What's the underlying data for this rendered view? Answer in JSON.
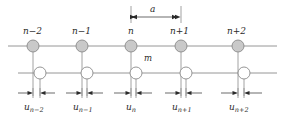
{
  "figure": {
    "type": "lattice-chain-diagram",
    "lattice_constant_label": "a",
    "mass_label": "m",
    "colors": {
      "shaded_atom_fill": "#c9c9c9",
      "shaded_atom_stroke": "#8a8a8a",
      "open_atom_fill": "#ffffff",
      "open_atom_stroke": "#8a8a8a",
      "line": "#8a8a8a",
      "arrow": "#2b2b2b",
      "text": "#2b2b2b"
    },
    "top_row": {
      "name": "shaded-atom-row",
      "atoms": [
        {
          "label_base": "n",
          "label_sub": "−2",
          "label": "n−2",
          "cx": 33,
          "cy": 46
        },
        {
          "label_base": "n",
          "label_sub": "−1",
          "label": "n−1",
          "cx": 82,
          "cy": 46
        },
        {
          "label_base": "n",
          "label_sub": "",
          "label": "n",
          "cx": 131,
          "cy": 46
        },
        {
          "label_base": "n",
          "label_sub": "+1",
          "label": "n+1",
          "cx": 181,
          "cy": 46
        },
        {
          "label_base": "n",
          "label_sub": "+2",
          "label": "n+2",
          "cx": 238,
          "cy": 46
        }
      ]
    },
    "bottom_row": {
      "name": "open-atom-row",
      "atoms": [
        {
          "cx": 40,
          "cy": 73
        },
        {
          "cx": 87,
          "cy": 73
        },
        {
          "cx": 136,
          "cy": 73
        },
        {
          "cx": 186,
          "cy": 73
        },
        {
          "cx": 244,
          "cy": 73
        }
      ]
    },
    "displacements": {
      "name": "displacement-labels",
      "items": [
        {
          "base": "u",
          "sub": "n−2",
          "label": "u",
          "x": 33,
          "tick_left": 33,
          "tick_right": 40
        },
        {
          "base": "u",
          "sub": "n−1",
          "label": "u",
          "x": 82,
          "tick_left": 82,
          "tick_right": 87
        },
        {
          "base": "u",
          "sub": "n",
          "label": "u",
          "x": 131,
          "tick_left": 131,
          "tick_right": 136
        },
        {
          "base": "u",
          "sub": "n+1",
          "label": "u",
          "x": 181,
          "tick_left": 181,
          "tick_right": 186
        },
        {
          "base": "u",
          "sub": "n+2",
          "label": "u",
          "x": 238,
          "tick_left": 238,
          "tick_right": 244
        }
      ]
    },
    "dimension": {
      "name": "lattice-constant-dimension",
      "label": "a",
      "x_start": 131,
      "x_end": 181,
      "y": 17
    }
  }
}
